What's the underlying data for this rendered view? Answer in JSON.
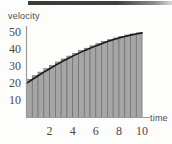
{
  "figure": {
    "background_color": "#fdfdfc",
    "ink_color": "#4a4a4a",
    "bar_fill_color": "#a6a6a6",
    "bar_edge_color": "#6e6e6e",
    "curve_color": "#1a1a1a",
    "axis_color": "#8a8a8a",
    "scan_artifact_color": "#3b3b3b"
  },
  "chart_data": {
    "type": "area",
    "title": "",
    "subtitle": "",
    "xlabel": "time",
    "ylabel": "velocity",
    "xlim": [
      0,
      10.6
    ],
    "ylim": [
      0,
      56
    ],
    "grid": false,
    "legend": null,
    "legend_position": "none",
    "annotations": [],
    "xticks": [
      2,
      4,
      6,
      8,
      10
    ],
    "xtick_labels": [
      "2",
      "4",
      "6",
      "8",
      "10"
    ],
    "yticks": [
      10,
      20,
      30,
      40,
      50
    ],
    "ytick_labels": [
      "10",
      "20",
      "30",
      "40",
      "50"
    ],
    "series": [
      {
        "name": "velocity curve",
        "type": "line",
        "x": [
          0,
          0.5,
          1,
          1.5,
          2,
          2.5,
          3,
          3.5,
          4,
          4.5,
          5,
          5.5,
          6,
          6.5,
          7,
          7.5,
          8,
          8.5,
          9,
          9.5,
          10
        ],
        "values": [
          20.0,
          22.3,
          24.5,
          26.6,
          28.6,
          30.6,
          32.5,
          34.3,
          36.0,
          37.6,
          39.2,
          40.6,
          42.0,
          43.3,
          44.5,
          45.6,
          46.6,
          47.5,
          48.3,
          49.0,
          49.6
        ]
      },
      {
        "name": "riemann rectangles",
        "type": "bar",
        "bar_count": 20,
        "bar_width": 0.5,
        "x_left_edges": [
          0,
          0.5,
          1,
          1.5,
          2,
          2.5,
          3,
          3.5,
          4,
          4.5,
          5,
          5.5,
          6,
          6.5,
          7,
          7.5,
          8,
          8.5,
          9,
          9.5
        ],
        "values": [
          22.3,
          24.5,
          26.6,
          28.6,
          30.6,
          32.5,
          34.3,
          36.0,
          37.6,
          39.2,
          40.6,
          42.0,
          43.3,
          44.5,
          45.6,
          46.6,
          47.5,
          48.3,
          49.0,
          49.6
        ]
      }
    ]
  }
}
